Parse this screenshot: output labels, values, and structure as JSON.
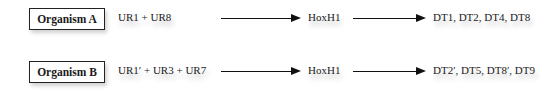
{
  "rows": [
    {
      "organism": "Organism A",
      "regulators": "UR1 + UR8",
      "gene": "HoxH1",
      "targets": "DT1, DT2, DT4, DT8"
    },
    {
      "organism": "Organism B",
      "regulators": "UR1′ + UR3 + UR7",
      "gene": "HoxH1",
      "targets": "DT2′, DT5, DT8′, DT9"
    }
  ],
  "icons": {
    "arrow": "right-arrow-icon"
  }
}
